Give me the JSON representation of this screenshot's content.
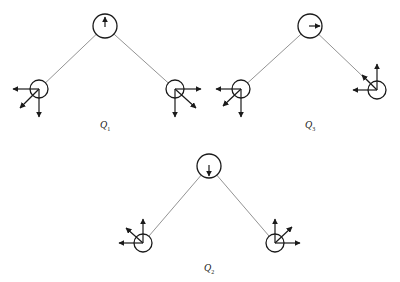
{
  "figure": {
    "colors": {
      "line": "#1a1a1a",
      "bond": "#777777",
      "background": "#ffffff"
    },
    "modes": [
      {
        "id": "Q1",
        "label": "Q",
        "subscript": "1",
        "label_pos": [
          100,
          119
        ],
        "central": {
          "cx": 105,
          "cy": 26,
          "r": 12,
          "arrow": "up",
          "vector": [
            0,
            -9
          ]
        },
        "left": {
          "cx": 39,
          "cy": 89,
          "r": 9,
          "vectors": [
            [
              -26,
              0
            ],
            [
              0,
              28
            ],
            [
              -19,
              19
            ]
          ]
        },
        "right": {
          "cx": 175,
          "cy": 89,
          "r": 9,
          "vectors": [
            [
              26,
              0
            ],
            [
              0,
              28
            ],
            [
              21,
              19
            ]
          ]
        }
      },
      {
        "id": "Q3",
        "label": "Q",
        "subscript": "3",
        "label_pos": [
          305,
          119
        ],
        "central": {
          "cx": 310,
          "cy": 26,
          "r": 12,
          "arrow": "right",
          "vector": [
            10,
            0
          ]
        },
        "left": {
          "cx": 241,
          "cy": 89,
          "r": 9,
          "vectors": [
            [
              -25,
              0
            ],
            [
              0,
              28
            ],
            [
              -18,
              17
            ]
          ]
        },
        "right": {
          "cx": 377,
          "cy": 90,
          "r": 9,
          "vectors": [
            [
              0,
              -26
            ],
            [
              -24,
              0
            ],
            [
              -15,
              -15
            ]
          ]
        }
      },
      {
        "id": "Q2",
        "label": "Q",
        "subscript": "2",
        "label_pos": [
          204,
          262
        ],
        "central": {
          "cx": 209,
          "cy": 166,
          "r": 12,
          "arrow": "down",
          "vector": [
            0,
            10
          ]
        },
        "left": {
          "cx": 143,
          "cy": 243,
          "r": 9,
          "vectors": [
            [
              0,
              -24
            ],
            [
              -24,
              0
            ],
            [
              -17,
              -15
            ]
          ]
        },
        "right": {
          "cx": 275,
          "cy": 243,
          "r": 9,
          "vectors": [
            [
              0,
              -24
            ],
            [
              25,
              0
            ],
            [
              17,
              -16
            ]
          ]
        }
      }
    ]
  }
}
